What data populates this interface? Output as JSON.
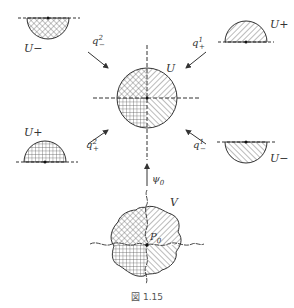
{
  "figure": {
    "caption": "図 1.15",
    "center_region": {
      "label": "U"
    },
    "top_left": {
      "label": "U−",
      "arrow_label_base": "q",
      "arrow_label_sup": "2",
      "arrow_label_sub": "−"
    },
    "top_right": {
      "label": "U+",
      "arrow_label_base": "q",
      "arrow_label_sup": "1",
      "arrow_label_sub": "+"
    },
    "bottom_left": {
      "label": "U+",
      "arrow_label_base": "q",
      "arrow_label_sup": "2",
      "arrow_label_sub": "+"
    },
    "bottom_right": {
      "label": "U−",
      "arrow_label_base": "q",
      "arrow_label_sup": "1",
      "arrow_label_sub": "−"
    },
    "bottom": {
      "region_label": "V",
      "point_label": "P",
      "point_sub": "0",
      "map_label": "ψ",
      "map_sub": "0"
    }
  }
}
